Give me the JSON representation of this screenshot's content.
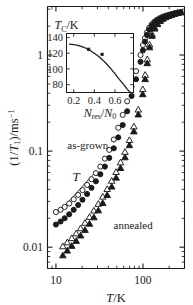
{
  "figure": {
    "name": "spin-lattice-relaxation-rate-vs-temperature",
    "background": "#ffffff",
    "ink": "#1a1a1a"
  },
  "chart_data": {
    "type": "scatter",
    "title": "",
    "subtitle": "",
    "xlabel": "T/K",
    "ylabel": "(1/T_1)/ms^-1",
    "xscale": "log",
    "yscale": "log",
    "xlim": [
      8,
      300
    ],
    "ylim": [
      0.006,
      3.2
    ],
    "grid": false,
    "legend_position": "in-plot-annotations",
    "xticks": [
      10,
      100
    ],
    "xticklabels": [
      "10",
      "100"
    ],
    "yticks": [
      1,
      0.1,
      0.01
    ],
    "yticklabels": [
      "1",
      "0.1",
      "0.01"
    ],
    "annotations": [
      {
        "text": "as-grown",
        "x": 13.5,
        "y": 0.105,
        "name": "as-grown-label"
      },
      {
        "text": "annealed",
        "x": 46,
        "y": 0.0155,
        "name": "annealed-label"
      },
      {
        "text": "T",
        "x": 15.5,
        "y": 0.049,
        "name": "t-power-law-label"
      }
    ],
    "guide_line": {
      "name": "linear-T-guide-line",
      "label": "T",
      "x": [
        11.0,
        27.0
      ],
      "y": [
        0.0235,
        0.0575
      ],
      "slope": 1
    },
    "series": [
      {
        "name": "as-grown open circles",
        "marker": "open-circle",
        "color": "#1a1a1a",
        "fill": "none",
        "points": [
          [
            10.0,
            0.0232
          ],
          [
            11.3,
            0.0245
          ],
          [
            12.6,
            0.0262
          ],
          [
            14.2,
            0.0285
          ],
          [
            16.0,
            0.0315
          ],
          [
            18.0,
            0.035
          ],
          [
            20.2,
            0.0392
          ],
          [
            22.8,
            0.0445
          ],
          [
            25.6,
            0.051
          ],
          [
            28.8,
            0.059
          ],
          [
            32.4,
            0.069
          ],
          [
            36.5,
            0.0835
          ],
          [
            41.0,
            0.103
          ],
          [
            46.2,
            0.132
          ],
          [
            52.0,
            0.175
          ],
          [
            58.5,
            0.238
          ],
          [
            65.8,
            0.33
          ],
          [
            74.0,
            0.47
          ],
          [
            83.3,
            0.68
          ],
          [
            93.7,
            1.0
          ],
          [
            100.0,
            1.27
          ],
          [
            105.4,
            1.5
          ],
          [
            111.0,
            1.72
          ],
          [
            118.0,
            1.92
          ],
          [
            126.0,
            2.09
          ],
          [
            135.0,
            2.22
          ],
          [
            145.0,
            2.33
          ],
          [
            156.0,
            2.42
          ],
          [
            168.0,
            2.5
          ],
          [
            181.0,
            2.56
          ],
          [
            196.0,
            2.62
          ],
          [
            212.0,
            2.67
          ],
          [
            230.0,
            2.72
          ],
          [
            250.0,
            2.76
          ],
          [
            270.0,
            2.8
          ]
        ]
      },
      {
        "name": "as-grown filled circles",
        "marker": "filled-circle",
        "color": "#1a1a1a",
        "fill": "#1a1a1a",
        "points": [
          [
            10.0,
            0.0172
          ],
          [
            11.3,
            0.0185
          ],
          [
            12.6,
            0.02
          ],
          [
            14.2,
            0.022
          ],
          [
            16.0,
            0.0245
          ],
          [
            18.0,
            0.0275
          ],
          [
            20.2,
            0.0312
          ],
          [
            22.8,
            0.0358
          ],
          [
            25.6,
            0.0415
          ],
          [
            28.8,
            0.0485
          ],
          [
            32.4,
            0.0575
          ],
          [
            36.5,
            0.069
          ],
          [
            41.0,
            0.085
          ],
          [
            46.2,
            0.107
          ],
          [
            52.0,
            0.139
          ],
          [
            58.5,
            0.187
          ],
          [
            65.8,
            0.26
          ],
          [
            74.0,
            0.375
          ],
          [
            83.3,
            0.56
          ],
          [
            93.7,
            0.85
          ],
          [
            100.0,
            1.12
          ],
          [
            105.4,
            1.38
          ],
          [
            111.0,
            1.62
          ],
          [
            118.0,
            1.84
          ],
          [
            126.0,
            2.02
          ],
          [
            135.0,
            2.16
          ],
          [
            145.0,
            2.28
          ],
          [
            156.0,
            2.38
          ],
          [
            168.0,
            2.46
          ],
          [
            181.0,
            2.53
          ],
          [
            196.0,
            2.59
          ],
          [
            212.0,
            2.65
          ],
          [
            230.0,
            2.7
          ],
          [
            250.0,
            2.75
          ],
          [
            270.0,
            2.79
          ]
        ]
      },
      {
        "name": "annealed open triangles",
        "marker": "open-triangle",
        "color": "#1a1a1a",
        "fill": "none",
        "points": [
          [
            12.0,
            0.0102
          ],
          [
            13.5,
            0.0112
          ],
          [
            15.2,
            0.0124
          ],
          [
            17.1,
            0.0139
          ],
          [
            19.2,
            0.0157
          ],
          [
            21.6,
            0.0179
          ],
          [
            24.3,
            0.0206
          ],
          [
            27.3,
            0.024
          ],
          [
            30.7,
            0.0282
          ],
          [
            34.5,
            0.0335
          ],
          [
            38.8,
            0.0402
          ],
          [
            43.7,
            0.049
          ],
          [
            49.1,
            0.0605
          ],
          [
            55.2,
            0.076
          ],
          [
            62.1,
            0.098
          ],
          [
            69.9,
            0.13
          ],
          [
            78.6,
            0.18
          ],
          [
            88.4,
            0.27
          ],
          [
            99.4,
            0.44
          ],
          [
            106.0,
            0.62
          ],
          [
            112.0,
            0.9
          ],
          [
            119.0,
            1.28
          ],
          [
            127.0,
            1.65
          ],
          [
            136.0,
            1.93
          ],
          [
            146.0,
            2.13
          ],
          [
            157.0,
            2.28
          ],
          [
            169.0,
            2.4
          ],
          [
            182.0,
            2.49
          ],
          [
            197.0,
            2.57
          ],
          [
            213.0,
            2.63
          ],
          [
            231.0,
            2.69
          ],
          [
            251.0,
            2.74
          ],
          [
            271.0,
            2.78
          ]
        ]
      },
      {
        "name": "annealed filled triangles",
        "marker": "filled-triangle",
        "color": "#1a1a1a",
        "fill": "#1a1a1a",
        "points": [
          [
            12.0,
            0.0082
          ],
          [
            13.5,
            0.0092
          ],
          [
            15.2,
            0.0103
          ],
          [
            17.1,
            0.0116
          ],
          [
            19.2,
            0.0132
          ],
          [
            21.6,
            0.0151
          ],
          [
            24.3,
            0.0175
          ],
          [
            27.3,
            0.0204
          ],
          [
            30.7,
            0.0241
          ],
          [
            34.5,
            0.0288
          ],
          [
            38.8,
            0.0348
          ],
          [
            43.7,
            0.0426
          ],
          [
            49.1,
            0.0528
          ],
          [
            55.2,
            0.0665
          ],
          [
            62.1,
            0.086
          ],
          [
            69.9,
            0.115
          ],
          [
            78.6,
            0.16
          ],
          [
            88.4,
            0.24
          ],
          [
            99.4,
            0.39
          ],
          [
            106.0,
            0.56
          ],
          [
            112.0,
            0.82
          ],
          [
            119.0,
            1.2
          ],
          [
            127.0,
            1.58
          ],
          [
            136.0,
            1.88
          ],
          [
            146.0,
            2.09
          ],
          [
            157.0,
            2.25
          ],
          [
            169.0,
            2.38
          ],
          [
            182.0,
            2.47
          ],
          [
            197.0,
            2.55
          ],
          [
            213.0,
            2.62
          ],
          [
            231.0,
            2.68
          ],
          [
            251.0,
            2.73
          ],
          [
            271.0,
            2.78
          ]
        ]
      }
    ],
    "inset": {
      "name": "curie-temperature-vs-residual-carrier-density",
      "type": "line",
      "xlabel": "N_res/N_0",
      "ylabel": "T_C/K",
      "xscale": "linear",
      "yscale": "linear",
      "xlim": [
        0.13,
        0.78
      ],
      "ylim": [
        70,
        145
      ],
      "grid": false,
      "xticks": [
        0.2,
        0.4,
        0.6
      ],
      "xticklabels": [
        "0.2",
        "0.4",
        "0.6"
      ],
      "yticks": [
        80,
        100,
        120,
        140
      ],
      "yticklabels": [
        "80",
        "100",
        "120",
        "140"
      ],
      "curve": {
        "name": "model-curve",
        "x": [
          0.16,
          0.2,
          0.24,
          0.28,
          0.32,
          0.36,
          0.4,
          0.44,
          0.48,
          0.52,
          0.56,
          0.6,
          0.64,
          0.68,
          0.72,
          0.75
        ],
        "y": [
          131.5,
          131.0,
          130.0,
          128.4,
          126.2,
          123.4,
          120.0,
          116.0,
          111.4,
          106.2,
          100.4,
          94.0,
          87.0,
          81.0,
          74.0,
          70.0
        ]
      },
      "points": {
        "name": "measured-points",
        "marker": "filled-square",
        "x": [
          0.345,
          0.475
        ],
        "y": [
          125.0,
          118.5
        ]
      }
    }
  }
}
